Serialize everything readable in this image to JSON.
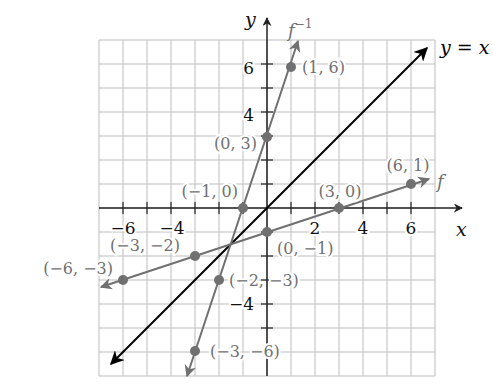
{
  "chart_data": {
    "type": "line",
    "title": "",
    "xlabel": "x",
    "ylabel": "y",
    "xlim": [
      -7,
      7
    ],
    "ylim": [
      -7,
      7
    ],
    "grid": true,
    "x_ticks": [
      -6,
      -4,
      2,
      4,
      6
    ],
    "y_ticks": [
      6,
      4,
      -4
    ],
    "x_tick_labels": [
      "−6",
      "−4",
      "2",
      "4",
      "6"
    ],
    "y_tick_labels": [
      "6",
      "4",
      "−4"
    ],
    "series": [
      {
        "name": "f",
        "label": "f",
        "color": "#707070",
        "points": [
          [
            -6,
            -3
          ],
          [
            -3,
            -2
          ],
          [
            0,
            -1
          ],
          [
            3,
            0
          ],
          [
            6,
            1
          ]
        ],
        "point_labels": [
          "(−6, −3)",
          "(−3, −2)",
          "(0, −1)",
          "(3, 0)",
          "(6, 1)"
        ]
      },
      {
        "name": "f_inverse",
        "label": "f⁻¹",
        "color": "#707070",
        "points": [
          [
            -3,
            -6
          ],
          [
            -2,
            -3
          ],
          [
            -1,
            0
          ],
          [
            0,
            3
          ],
          [
            1,
            6
          ]
        ],
        "point_labels": [
          "(−3, −6)",
          "(−2, −3)",
          "(−1, 0)",
          "(0, 3)",
          "(1, 6)"
        ]
      },
      {
        "name": "identity",
        "label": "y = x",
        "color": "#000000",
        "points": [
          [
            -7,
            -7
          ],
          [
            7,
            7
          ]
        ],
        "point_labels": []
      }
    ]
  },
  "labels": {
    "x_axis": "x",
    "y_axis": "y",
    "identity_line": "y = x",
    "f": "f",
    "f_inverse_base": "f",
    "f_inverse_sup": "−1",
    "tick_x_neg6": "−6",
    "tick_x_neg4": "−4",
    "tick_x_2": "2",
    "tick_x_4": "4",
    "tick_x_6": "6",
    "tick_y_6": "6",
    "tick_y_4": "4",
    "tick_y_neg4": "−4",
    "pt_1_6": "(1, 6)",
    "pt_0_3": "(0, 3)",
    "pt_neg1_0": "(−1, 0)",
    "pt_3_0": "(3, 0)",
    "pt_6_1": "(6, 1)",
    "pt_neg3_neg2": "(−3, −2)",
    "pt_neg6_neg3": "(−6, −3)",
    "pt_0_neg1": "(0, −1)",
    "pt_neg2_neg3": "(−2, −3)",
    "pt_neg3_neg6": "(−3, −6)"
  }
}
